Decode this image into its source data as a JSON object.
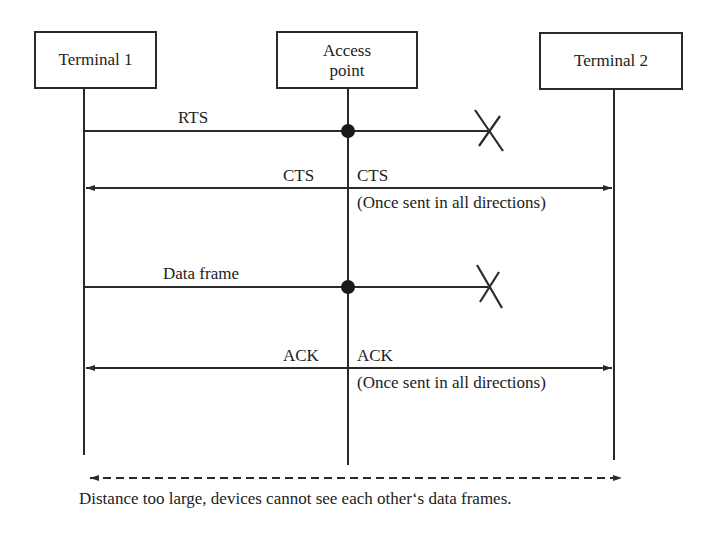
{
  "diagram": {
    "type": "sequence",
    "participants": [
      {
        "id": "t1",
        "label": "Terminal 1"
      },
      {
        "id": "ap",
        "label": "Access point",
        "label_lines": [
          "Access",
          "point"
        ]
      },
      {
        "id": "t2",
        "label": "Terminal 2"
      }
    ],
    "messages": [
      {
        "label": "RTS",
        "from": "Terminal 1",
        "to": "Access point",
        "continues_to": "Terminal 2",
        "blocked": true
      },
      {
        "label_left": "CTS",
        "label_right": "CTS",
        "from": "Access point",
        "to": [
          "Terminal 1",
          "Terminal 2"
        ],
        "note": "(Once sent in all directions)"
      },
      {
        "label": "Data frame",
        "from": "Terminal 1",
        "to": "Access point",
        "continues_to": "Terminal 2",
        "blocked": true
      },
      {
        "label_left": "ACK",
        "label_right": "ACK",
        "from": "Access point",
        "to": [
          "Terminal 1",
          "Terminal 2"
        ],
        "note": "(Once sent in all directions)"
      }
    ],
    "footer": {
      "caption": "Distance too large, devices cannot see each other‘s data frames."
    }
  }
}
